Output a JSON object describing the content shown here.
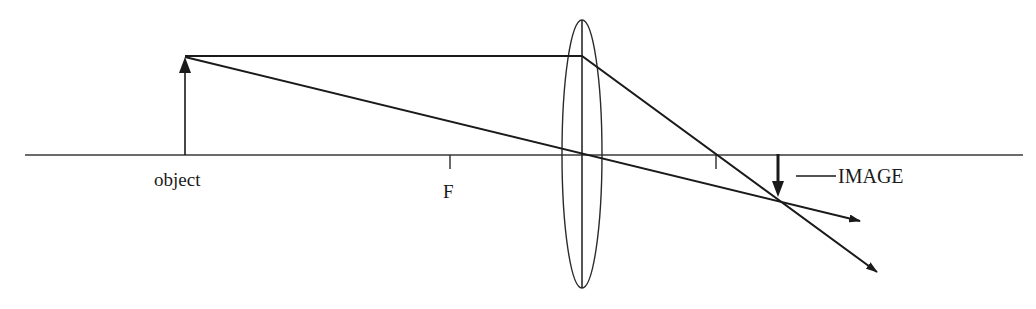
{
  "diagram": {
    "type": "thin-lens-ray-diagram",
    "colors": {
      "stroke": "#1a1a1a",
      "axis": "#3a3a3a",
      "background": "#ffffff"
    },
    "labels": {
      "object": "object",
      "focal_point": "F",
      "image": "IMAGE",
      "image_leader": "—"
    },
    "elements": {
      "optical_axis": {
        "x1": 25,
        "x2": 1023,
        "y": 155
      },
      "lens": {
        "cx": 582,
        "cy": 154,
        "rx": 20,
        "ry": 134
      },
      "object_arrow": {
        "x": 185,
        "y_base": 155,
        "y_tip": 57,
        "direction": "up"
      },
      "image_arrow": {
        "x": 778,
        "y_base": 155,
        "y_tip": 197,
        "direction": "down"
      },
      "focal_ticks": [
        {
          "x": 450,
          "label": "F"
        },
        {
          "x": 716,
          "label": ""
        }
      ],
      "rays": [
        {
          "name": "parallel-ray",
          "points": [
            [
              185,
              56
            ],
            [
              582,
              56
            ],
            [
              877,
              272
            ]
          ],
          "arrow": true
        },
        {
          "name": "central-ray",
          "points": [
            [
              185,
              57
            ],
            [
              860,
              221
            ]
          ],
          "arrow": true
        }
      ]
    }
  }
}
